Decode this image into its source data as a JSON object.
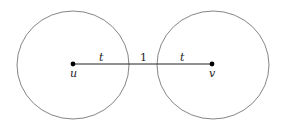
{
  "diagram": {
    "nodes": [
      {
        "id": "u",
        "label": "u",
        "cx": 73,
        "cy": 64
      },
      {
        "id": "v",
        "label": "v",
        "cx": 212,
        "cy": 64
      }
    ],
    "circles": [
      {
        "around": "u",
        "cx": 73,
        "cy": 65,
        "rx": 56,
        "ry": 54
      },
      {
        "around": "v",
        "cx": 213,
        "cy": 65,
        "rx": 56,
        "ry": 54
      }
    ],
    "segment": {
      "from": "u",
      "to": "v"
    },
    "edge_labels": {
      "left_radius": "t",
      "gap": "1",
      "right_radius": "t"
    },
    "colors": {
      "circle_stroke": "#666666",
      "line": "#222222",
      "point": "#000000"
    }
  }
}
